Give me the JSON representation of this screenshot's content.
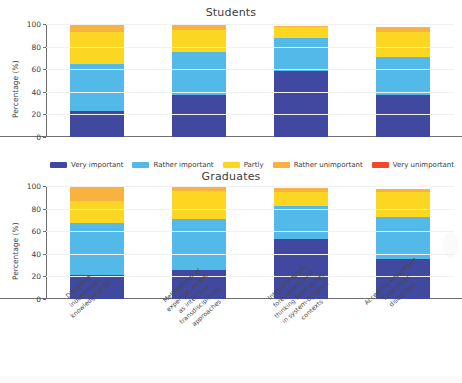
{
  "figure": {
    "categories": [
      [
        "Discipline-",
        "independent",
        "knowledge of SD"
      ],
      [
        "Methodological",
        "expertise, as well",
        "as inter- and",
        "transdisciplinary",
        "approaches"
      ],
      [
        "Interconnected,",
        "foresighted, and",
        "thinking approaches",
        "in system-dynamic",
        "contexts"
      ],
      [
        "Accessing knowledge",
        "from other",
        "disciplines"
      ]
    ],
    "colors": {
      "very_important": "#40489f",
      "rather_important": "#52b9e9",
      "partly": "#fbd724",
      "rather_unimportant": "#f7b23f",
      "very_unimportant": "#f4482a",
      "axis": "#6d6d6d",
      "grid": "#f1f1f1",
      "text": "#3c3c3c"
    },
    "legend": {
      "position": "between-panels",
      "items": [
        {
          "label": "Very important",
          "color": "#40489f"
        },
        {
          "label": "Rather important",
          "color": "#52b9e9"
        },
        {
          "label": "Partly",
          "color": "#fbd724"
        },
        {
          "label": "Rather unimportant",
          "color": "#f7b23f"
        },
        {
          "label": "Very unimportant",
          "color": "#f4482a"
        }
      ]
    }
  },
  "chart_data": [
    {
      "type": "bar",
      "subtype": "stacked-bar",
      "title": "Students",
      "xlabel": "",
      "ylabel": "Percentage (%)",
      "ylim": [
        0,
        100
      ],
      "yticks": [
        0,
        20,
        40,
        60,
        80,
        100
      ],
      "grid": true,
      "legend_position": "below",
      "categories": [
        "Discipline-independent knowledge of SD",
        "Methodological expertise, as well as inter- and transdisciplinary approaches",
        "Interconnected, foresighted, and thinking approaches in system-dynamic contexts",
        "Accessing knowledge from other disciplines"
      ],
      "series": [
        {
          "name": "Very important",
          "values": [
            23,
            37,
            58,
            37
          ]
        },
        {
          "name": "Rather important",
          "values": [
            42,
            38,
            30,
            34
          ]
        },
        {
          "name": "Partly",
          "values": [
            28,
            20,
            9,
            22
          ]
        },
        {
          "name": "Rather unimportant",
          "values": [
            7,
            4,
            1,
            4
          ]
        },
        {
          "name": "Very unimportant",
          "values": [
            0,
            0,
            0,
            0
          ]
        }
      ]
    },
    {
      "type": "bar",
      "subtype": "stacked-bar",
      "title": "Graduates",
      "xlabel": "",
      "ylabel": "Percentage (%)",
      "ylim": [
        0,
        100
      ],
      "yticks": [
        0,
        20,
        40,
        60,
        80,
        100
      ],
      "grid": true,
      "legend_position": "above",
      "categories": [
        "Discipline-independent knowledge of SD",
        "Methodological expertise, as well as inter- and transdisciplinary approaches",
        "Interconnected, foresighted, and thinking approaches in system-dynamic contexts",
        "Accessing knowledge from other disciplines"
      ],
      "series": [
        {
          "name": "Very important",
          "values": [
            21,
            26,
            53,
            35
          ]
        },
        {
          "name": "Rather important",
          "values": [
            46,
            45,
            29,
            38
          ]
        },
        {
          "name": "Partly",
          "values": [
            20,
            25,
            13,
            22
          ]
        },
        {
          "name": "Rather unimportant",
          "values": [
            13,
            3,
            3,
            2
          ]
        },
        {
          "name": "Very unimportant",
          "values": [
            0,
            0,
            0,
            0
          ]
        }
      ]
    }
  ],
  "yaxis": {
    "tick_labels": [
      "0",
      "20",
      "40",
      "60",
      "80",
      "100"
    ],
    "label": "Percentage (%)"
  }
}
